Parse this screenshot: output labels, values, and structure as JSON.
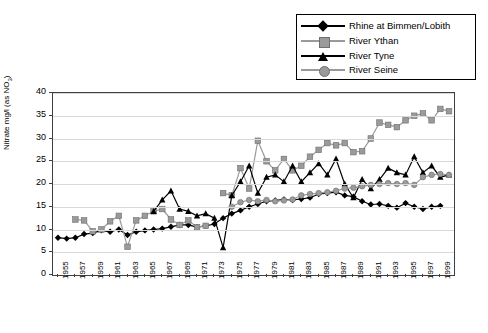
{
  "chart_data": {
    "type": "line",
    "title": "",
    "xlabel": "",
    "ylabel": "Nitrate mg/l (as NO3)",
    "ylabel_main": "Nitrate mg/l (as NO",
    "ylabel_sub": "3",
    "ylabel_tail": ")",
    "ylim": [
      0,
      40
    ],
    "yticks": [
      0,
      5,
      10,
      15,
      20,
      25,
      30,
      35,
      40
    ],
    "grid": true,
    "legend_position": "top-right",
    "x": [
      1955,
      1956,
      1957,
      1958,
      1959,
      1960,
      1961,
      1962,
      1963,
      1964,
      1965,
      1966,
      1967,
      1968,
      1969,
      1970,
      1971,
      1972,
      1973,
      1974,
      1975,
      1976,
      1977,
      1978,
      1979,
      1980,
      1981,
      1982,
      1983,
      1984,
      1985,
      1986,
      1987,
      1988,
      1989,
      1990,
      1991,
      1992,
      1993,
      1994,
      1995,
      1996,
      1997,
      1998,
      1999,
      2000
    ],
    "xticks": [
      "1955",
      "1957",
      "1959",
      "1961",
      "1963",
      "1965",
      "1967",
      "1969",
      "1971",
      "1973",
      "1975",
      "1977",
      "1979",
      "1981",
      "1983",
      "1985",
      "1987",
      "1989",
      "1991",
      "1993",
      "1995",
      "1997",
      "1999"
    ],
    "series": [
      {
        "name": "Rhine at Bimmen/Lobith",
        "color": "#000000",
        "marker": "diamond",
        "values": [
          8.2,
          8.0,
          8.2,
          9.0,
          9.2,
          9.8,
          9.5,
          10.0,
          8.8,
          9.5,
          9.8,
          10.0,
          10.2,
          10.6,
          11.0,
          11.0,
          10.5,
          10.8,
          11.2,
          12.5,
          13.5,
          14.2,
          15.0,
          15.6,
          16.2,
          16.4,
          16.6,
          16.5,
          16.7,
          17.0,
          17.8,
          18.0,
          18.2,
          17.5,
          17.2,
          16.2,
          15.5,
          15.6,
          15.2,
          14.8,
          15.8,
          15.0,
          14.5,
          15.0,
          15.2,
          null
        ]
      },
      {
        "name": "River Ythan",
        "color": "#9a9a9a",
        "marker": "square",
        "values": [
          null,
          null,
          12.2,
          12.0,
          9.6,
          10.0,
          11.8,
          13.0,
          6.2,
          12.0,
          13.0,
          14.0,
          14.5,
          12.2,
          11.0,
          12.0,
          10.5,
          10.8,
          null,
          18.0,
          17.5,
          23.5,
          19.0,
          29.5,
          25.0,
          23.0,
          25.5,
          23.0,
          24.0,
          26.0,
          27.5,
          29.0,
          28.5,
          29.0,
          27.0,
          27.2,
          30.0,
          33.5,
          33.0,
          32.5,
          34.0,
          35.0,
          35.5,
          34.0,
          36.5,
          36.0
        ]
      },
      {
        "name": "River Tyne",
        "color": "#000000",
        "marker": "triangle",
        "values": [
          null,
          null,
          null,
          null,
          null,
          null,
          null,
          null,
          null,
          null,
          null,
          14.0,
          16.5,
          18.5,
          14.5,
          14.0,
          13.0,
          13.5,
          12.5,
          6.0,
          17.5,
          20.5,
          24.0,
          18.0,
          21.5,
          22.0,
          20.5,
          24.0,
          20.5,
          22.5,
          24.5,
          22.0,
          25.5,
          20.0,
          17.0,
          21.0,
          19.0,
          21.0,
          23.5,
          22.5,
          22.0,
          26.0,
          22.5,
          24.0,
          21.5,
          22.0
        ]
      },
      {
        "name": "River Seine",
        "color": "#9a9a9a",
        "marker": "circle",
        "values": [
          null,
          null,
          null,
          null,
          null,
          null,
          null,
          null,
          null,
          null,
          null,
          null,
          null,
          null,
          null,
          null,
          null,
          null,
          null,
          null,
          15.0,
          16.0,
          16.5,
          16.2,
          16.5,
          16.2,
          16.4,
          16.6,
          17.5,
          17.8,
          18.0,
          18.2,
          18.5,
          19.0,
          19.2,
          19.5,
          19.8,
          20.0,
          20.2,
          20.0,
          20.2,
          19.8,
          21.5,
          22.0,
          22.2,
          22.0
        ]
      }
    ]
  },
  "legend": {
    "items": [
      {
        "label": "Rhine at Bimmen/Lobith",
        "icon": "diamond-marker-icon"
      },
      {
        "label": "River Ythan",
        "icon": "square-marker-icon"
      },
      {
        "label": "River Tyne",
        "icon": "triangle-marker-icon"
      },
      {
        "label": "River Seine",
        "icon": "circle-marker-icon"
      }
    ]
  }
}
